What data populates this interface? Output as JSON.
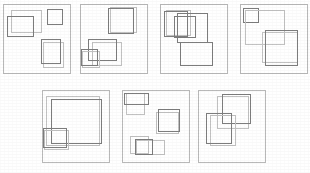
{
  "figure": {
    "title": "",
    "width": 310,
    "height": 173,
    "background": "#ffffff",
    "panel_count": 7,
    "rows": [
      4,
      3
    ],
    "colors": {
      "panel_border": "#b9b9b9",
      "light_rect": "#c2c2c2",
      "dark_rect": "#7d7d7d",
      "background": "#ffffff"
    },
    "legend": {
      "light_meaning": "light-gray rectangle",
      "dark_meaning": "dark-gray rectangle"
    }
  },
  "panels": [
    {
      "id": "panel-1",
      "label": "",
      "x": 3,
      "y": 4,
      "w": 68,
      "h": 70,
      "rects": [
        {
          "name": "rect-light-1",
          "style": "light",
          "x": 8,
          "y": 6,
          "w": 31,
          "h": 23
        },
        {
          "name": "rect-dark-1",
          "style": "dark",
          "x": 4,
          "y": 12,
          "w": 27,
          "h": 21
        },
        {
          "name": "rect-dark-2",
          "style": "dark",
          "x": 44,
          "y": 5,
          "w": 16,
          "h": 16
        },
        {
          "name": "rect-light-2",
          "style": "light",
          "x": 40,
          "y": 38,
          "w": 21,
          "h": 26
        },
        {
          "name": "rect-dark-3",
          "style": "dark",
          "x": 38,
          "y": 35,
          "w": 20,
          "h": 25
        }
      ]
    },
    {
      "id": "panel-2",
      "label": "",
      "x": 80,
      "y": 4,
      "w": 68,
      "h": 70,
      "rects": [
        {
          "name": "rect-light-1",
          "style": "light",
          "x": 30,
          "y": 3,
          "w": 27,
          "h": 26
        },
        {
          "name": "rect-dark-1",
          "style": "dark",
          "x": 28,
          "y": 4,
          "w": 26,
          "h": 26
        },
        {
          "name": "rect-light-2",
          "style": "light",
          "x": 12,
          "y": 38,
          "w": 30,
          "h": 24
        },
        {
          "name": "rect-dark-2",
          "style": "dark",
          "x": 8,
          "y": 35,
          "w": 29,
          "h": 22
        },
        {
          "name": "rect-light-3",
          "style": "light",
          "x": 2,
          "y": 47,
          "w": 18,
          "h": 17
        },
        {
          "name": "rect-dark-3",
          "style": "dark",
          "x": 1,
          "y": 45,
          "w": 17,
          "h": 17
        }
      ]
    },
    {
      "id": "panel-3",
      "label": "",
      "x": 160,
      "y": 4,
      "w": 68,
      "h": 70,
      "rects": [
        {
          "name": "rect-light-1",
          "style": "light",
          "x": 6,
          "y": 6,
          "w": 25,
          "h": 26
        },
        {
          "name": "rect-dark-1",
          "style": "dark",
          "x": 4,
          "y": 7,
          "w": 24,
          "h": 26
        },
        {
          "name": "rect-dark-2",
          "style": "dark",
          "x": 14,
          "y": 12,
          "w": 22,
          "h": 22
        },
        {
          "name": "rect-dark-3",
          "style": "dark",
          "x": 17,
          "y": 9,
          "w": 31,
          "h": 30
        },
        {
          "name": "rect-dark-4",
          "style": "dark",
          "x": 20,
          "y": 38,
          "w": 33,
          "h": 24
        }
      ]
    },
    {
      "id": "panel-4",
      "label": "",
      "x": 240,
      "y": 4,
      "w": 68,
      "h": 70,
      "rects": [
        {
          "name": "rect-dark-1",
          "style": "dark",
          "x": 3,
          "y": 4,
          "w": 16,
          "h": 15
        },
        {
          "name": "rect-light-1",
          "style": "light",
          "x": 5,
          "y": 6,
          "w": 40,
          "h": 35
        },
        {
          "name": "rect-light-2",
          "style": "light",
          "x": 22,
          "y": 28,
          "w": 36,
          "h": 31
        },
        {
          "name": "rect-dark-2",
          "style": "dark",
          "x": 25,
          "y": 26,
          "w": 33,
          "h": 36
        }
      ]
    },
    {
      "id": "panel-5",
      "label": "",
      "x": 42,
      "y": 90,
      "w": 68,
      "h": 73,
      "rects": [
        {
          "name": "rect-light-1",
          "style": "light",
          "x": 4,
          "y": 6,
          "w": 54,
          "h": 50
        },
        {
          "name": "rect-dark-1",
          "style": "dark",
          "x": 9,
          "y": 9,
          "w": 51,
          "h": 45
        },
        {
          "name": "rect-light-2",
          "style": "light",
          "x": 2,
          "y": 40,
          "w": 25,
          "h": 20
        },
        {
          "name": "rect-dark-2",
          "style": "dark",
          "x": 1,
          "y": 38,
          "w": 24,
          "h": 20
        }
      ]
    },
    {
      "id": "panel-6",
      "label": "",
      "x": 122,
      "y": 90,
      "w": 68,
      "h": 73,
      "rects": [
        {
          "name": "rect-light-1",
          "style": "light",
          "x": 4,
          "y": 3,
          "w": 19,
          "h": 22
        },
        {
          "name": "rect-dark-1",
          "style": "dark",
          "x": 2,
          "y": 3,
          "w": 25,
          "h": 12
        },
        {
          "name": "rect-light-2",
          "style": "light",
          "x": 34,
          "y": 22,
          "w": 23,
          "h": 22
        },
        {
          "name": "rect-dark-2",
          "style": "dark",
          "x": 36,
          "y": 19,
          "w": 22,
          "h": 23
        },
        {
          "name": "rect-light-3",
          "style": "light",
          "x": 8,
          "y": 46,
          "w": 19,
          "h": 18
        },
        {
          "name": "rect-light-4",
          "style": "light",
          "x": 14,
          "y": 50,
          "w": 29,
          "h": 15
        },
        {
          "name": "rect-dark-3",
          "style": "dark",
          "x": 13,
          "y": 49,
          "w": 18,
          "h": 16
        }
      ]
    },
    {
      "id": "panel-7",
      "label": "",
      "x": 198,
      "y": 90,
      "w": 68,
      "h": 73,
      "rects": [
        {
          "name": "rect-light-1",
          "style": "light",
          "x": 19,
          "y": 6,
          "w": 32,
          "h": 33
        },
        {
          "name": "rect-dark-1",
          "style": "dark",
          "x": 24,
          "y": 4,
          "w": 29,
          "h": 30
        },
        {
          "name": "rect-light-2",
          "style": "light",
          "x": 12,
          "y": 25,
          "w": 26,
          "h": 31
        },
        {
          "name": "rect-dark-2",
          "style": "dark",
          "x": 8,
          "y": 23,
          "w": 26,
          "h": 31
        }
      ]
    }
  ]
}
